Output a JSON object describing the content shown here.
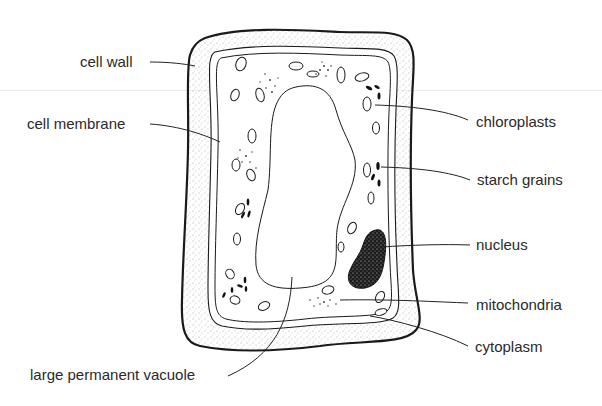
{
  "diagram": {
    "labels": {
      "cell_wall": "cell wall",
      "cell_membrane": "cell membrane",
      "chloroplasts": "chloroplasts",
      "starch_grains": "starch grains",
      "nucleus": "nucleus",
      "mitochondria": "mitochondria",
      "cytoplasm": "cytoplasm",
      "vacuole": "large permanent vacuole"
    },
    "colors": {
      "outline": "#1a1a1a",
      "text": "#2a2a2a",
      "stipple": "#555555",
      "background": "#ffffff"
    }
  }
}
